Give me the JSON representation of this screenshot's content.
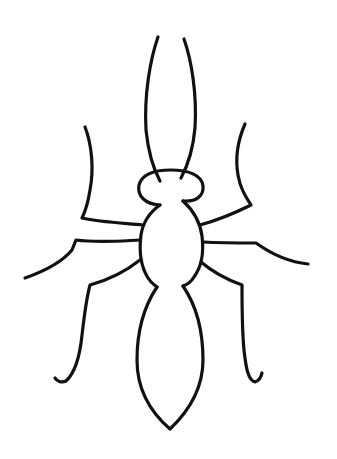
{
  "image": {
    "subject": "ant line drawing",
    "background": "#ffffff",
    "stroke_color": "#111111",
    "stroke_width": 3.2
  }
}
